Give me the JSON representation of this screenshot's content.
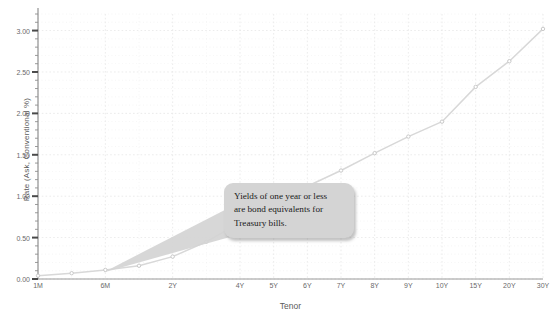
{
  "chart_data": {
    "type": "line",
    "title": "",
    "xlabel": "Tenor",
    "ylabel": "Rate (Ask, Conventional %)",
    "ylim": [
      0.0,
      3.2
    ],
    "ytick_labels": [
      "0.00",
      "0.50",
      "1.00",
      "1.50",
      "2.00",
      "2.50",
      "3.00"
    ],
    "ytick_values": [
      0.0,
      0.5,
      1.0,
      1.5,
      2.0,
      2.5,
      3.0
    ],
    "yminor_step": 0.1,
    "grid": true,
    "legend": "none",
    "categories": [
      "1M",
      "3M",
      "6M",
      "1Y",
      "2Y",
      "3Y",
      "4Y",
      "5Y",
      "6Y",
      "7Y",
      "8Y",
      "9Y",
      "10Y",
      "15Y",
      "20Y",
      "30Y"
    ],
    "xtick_labels": [
      "1M",
      "6M",
      "2Y",
      "4Y",
      "5Y",
      "6Y",
      "7Y",
      "8Y",
      "9Y",
      "10Y",
      "15Y",
      "20Y",
      "30Y"
    ],
    "xtick_positions": [
      0,
      2,
      4,
      6,
      7,
      8,
      9,
      10,
      11,
      12,
      13,
      14,
      15
    ],
    "values": [
      0.04,
      0.07,
      0.11,
      0.16,
      0.27,
      0.45,
      0.68,
      0.92,
      1.12,
      1.31,
      1.52,
      1.72,
      1.9,
      2.32,
      2.63,
      3.02
    ],
    "marker": "circle",
    "line_color": "#d8d8d8",
    "marker_color": "#c9c9c9",
    "grid_color": "#e6e6e6",
    "axis_color": "#9a9a9a",
    "background_color": "#ffffff"
  },
  "callout": {
    "lines": [
      "Yields of one year or less",
      "are bond equivalents for",
      "Treasury bills."
    ],
    "fill_color": "#d4d4d4"
  }
}
